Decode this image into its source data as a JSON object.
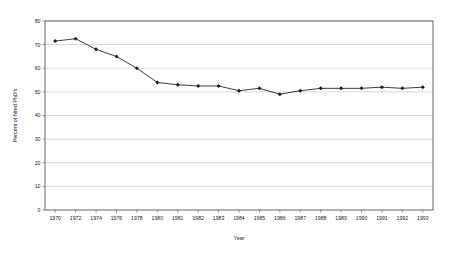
{
  "chart_data": {
    "type": "line",
    "title": "",
    "xlabel": "Year",
    "ylabel": "Percent of hired PhD's",
    "ylim": [
      0,
      80
    ],
    "ytick_step": 10,
    "yticks": [
      0,
      10,
      20,
      30,
      40,
      50,
      60,
      70,
      80
    ],
    "grid": true,
    "legend": false,
    "marker": "diamond",
    "line_color": "#1a1a1a",
    "grid_color": "#b3b3b3",
    "frame_color": "#555555",
    "categories": [
      "1970",
      "1972",
      "1974",
      "1976",
      "1978",
      "1980",
      "1981",
      "1982",
      "1983",
      "1984",
      "1985",
      "1986",
      "1987",
      "1988",
      "1989",
      "1990",
      "1991",
      "1992",
      "1993"
    ],
    "values": [
      71.5,
      72.5,
      68,
      65,
      60,
      54,
      53,
      52.5,
      52.5,
      50.5,
      51.5,
      49,
      50.5,
      51.5,
      51.5,
      51.5,
      52,
      51.5,
      52
    ],
    "series": [
      {
        "name": "Percent of hired PhD's",
        "values": [
          71.5,
          72.5,
          68,
          65,
          60,
          54,
          53,
          52.5,
          52.5,
          50.5,
          51.5,
          49,
          50.5,
          51.5,
          51.5,
          51.5,
          52,
          51.5,
          52
        ]
      }
    ]
  }
}
